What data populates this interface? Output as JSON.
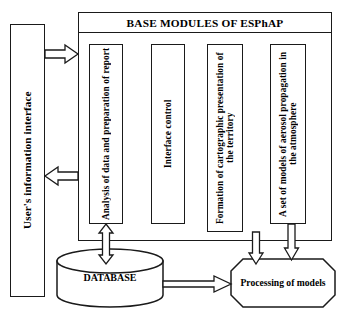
{
  "diagram": {
    "title": "BASE MODULES OF ESPhAP",
    "sidebar": {
      "label": "User's information interface"
    },
    "modules": [
      {
        "id": "analysis",
        "label": "Analysis of data and preparation of report"
      },
      {
        "id": "interface-control",
        "label": "Interface control"
      },
      {
        "id": "cartographic",
        "label": "Formation of cartographic presentation of the territory"
      },
      {
        "id": "aerosol-models",
        "label": "A set of models of aerosol propagation in the atmosphere"
      }
    ],
    "database": {
      "label": "DATABASE"
    },
    "processing": {
      "label": "Processing of models"
    },
    "connectors": [
      {
        "id": "user-to-modules",
        "direction": "right",
        "from": "User's information interface",
        "to": "BASE MODULES OF ESPhAP"
      },
      {
        "id": "modules-to-user",
        "direction": "left",
        "from": "BASE MODULES OF ESPhAP",
        "to": "User's information interface"
      },
      {
        "id": "analysis-database",
        "direction": "both",
        "from": "Analysis of data and preparation of report",
        "to": "DATABASE"
      },
      {
        "id": "database-to-processing",
        "direction": "right",
        "from": "DATABASE",
        "to": "Processing of models"
      },
      {
        "id": "processing-to-cartographic",
        "direction": "up",
        "from": "Processing of models",
        "to": "Formation of cartographic presentation of the territory"
      },
      {
        "id": "aerosol-to-processing",
        "direction": "down",
        "from": "A set of models of aerosol propagation in the atmosphere",
        "to": "Processing of models"
      }
    ],
    "colors": {
      "stroke": "#1a1a1a",
      "fill": "#ffffff",
      "text": "#000000"
    }
  }
}
